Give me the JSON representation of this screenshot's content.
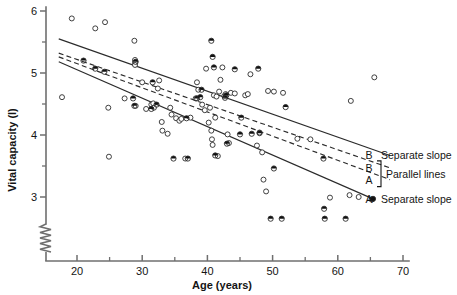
{
  "chart_data": {
    "type": "scatter",
    "title": "",
    "xlabel": "Age  (years)",
    "ylabel": "Vital capacity (l)",
    "xlim": [
      15,
      70
    ],
    "ylim": [
      2.55,
      6
    ],
    "xticks": [
      20,
      30,
      40,
      50,
      60,
      70
    ],
    "xminorticks": [
      25,
      35,
      45,
      55,
      65
    ],
    "yticks": [
      3,
      4,
      5,
      6
    ],
    "yminorticks": [
      3.5,
      4.5,
      5.5
    ],
    "yaxis_break": true,
    "grid": false,
    "legend_position": "right-inside",
    "series": [
      {
        "name": "A",
        "marker": "open-circle",
        "x": [
          17.7,
          19.2,
          22.8,
          24.3,
          24.8,
          24.9,
          27.3,
          28.8,
          29.0,
          28.9,
          28.9,
          28.9,
          30.0,
          30.6,
          31.4,
          31.7,
          31.8,
          32.4,
          32.6,
          33.0,
          33.1,
          33.9,
          34.3,
          34.5,
          35.2,
          35.7,
          36.0,
          36.6,
          37.4,
          38.2,
          38.4,
          38.6,
          39.2,
          39.6,
          39.8,
          40.2,
          40.4,
          40.6,
          40.7,
          40.8,
          41.0,
          41.2,
          41.4,
          41.6,
          41.8,
          42.0,
          42.3,
          42.6,
          42.8,
          43.1,
          43.3,
          43.6,
          44.2,
          45.8,
          46.2,
          46.6,
          47.6,
          48.0,
          48.4,
          48.6,
          49.0,
          49.3,
          50.2,
          51.6,
          53.8,
          55.8,
          58.8,
          61.8,
          62.0,
          63.2,
          65.6
        ],
        "y": [
          4.61,
          5.88,
          5.72,
          5.82,
          4.44,
          3.65,
          4.59,
          5.52,
          4.47,
          5.21,
          5.17,
          5.13,
          4.85,
          4.42,
          4.49,
          4.51,
          4.44,
          4.75,
          4.88,
          4.21,
          4.07,
          4.02,
          4.44,
          4.33,
          4.27,
          4.23,
          4.26,
          3.62,
          4.28,
          4.59,
          4.85,
          4.73,
          4.49,
          4.4,
          5.07,
          4.2,
          4.44,
          4.07,
          3.93,
          3.84,
          4.64,
          4.28,
          4.62,
          3.66,
          4.7,
          4.89,
          5.09,
          4.63,
          4.66,
          4.01,
          3.87,
          4.68,
          4.67,
          4.64,
          4.66,
          4.98,
          3.83,
          4.04,
          3.72,
          3.28,
          3.09,
          4.71,
          4.7,
          4.68,
          3.94,
          3.93,
          2.99,
          3.03,
          4.55,
          3.0,
          4.93
        ]
      },
      {
        "name": "B",
        "marker": "half-filled-circle",
        "x": [
          21.0,
          22.8,
          24.2,
          28.6,
          28.8,
          29.0,
          31.4,
          31.6,
          32.2,
          34.8,
          36.8,
          37.0,
          38.4,
          38.9,
          39.1,
          40.6,
          40.8,
          41.2,
          41.0,
          42.7,
          42.9,
          43.0,
          44.2,
          45.0,
          45.2,
          46.8,
          47.8,
          48.0,
          49.7,
          50.2,
          51.4,
          52.0,
          57.8,
          57.9,
          58.0,
          61.2,
          65.2
        ],
        "y": [
          5.2,
          5.07,
          5.02,
          4.59,
          4.47,
          5.18,
          4.42,
          4.85,
          4.49,
          3.62,
          4.27,
          3.62,
          4.59,
          4.61,
          4.73,
          5.52,
          5.26,
          3.67,
          5.09,
          4.6,
          4.64,
          3.86,
          5.06,
          4.01,
          4.28,
          4.02,
          5.07,
          4.03,
          2.65,
          3.46,
          2.65,
          4.45,
          3.62,
          2.81,
          2.65,
          2.65,
          2.96
        ]
      }
    ],
    "fit_lines": [
      {
        "id": "B-separate",
        "label": "B",
        "note": "Separate slope",
        "style": "solid",
        "x1": 17.2,
        "y1": 5.55,
        "x2": 68.0,
        "y2": 3.67
      },
      {
        "id": "B-parallel",
        "label": "B",
        "note": "Parallel lines",
        "style": "dashed",
        "x1": 17.2,
        "y1": 5.32,
        "x2": 68.0,
        "y2": 3.47
      },
      {
        "id": "A-parallel",
        "label": "A",
        "note": "Parallel lines",
        "style": "dashed",
        "x1": 17.2,
        "y1": 5.26,
        "x2": 68.0,
        "y2": 3.28
      },
      {
        "id": "A-separate",
        "label": "A",
        "note": "Separate slope",
        "style": "solid",
        "x1": 17.2,
        "y1": 5.18,
        "x2": 65.4,
        "y2": 2.97
      }
    ],
    "annotations": [
      {
        "name": "legend-b-separate",
        "key": "B",
        "text": "Separate slope"
      },
      {
        "name": "legend-b-parallel",
        "key": "B",
        "text": ""
      },
      {
        "name": "legend-parallel-group",
        "key": "",
        "text": "Parallel lines"
      },
      {
        "name": "legend-a-parallel",
        "key": "A",
        "text": ""
      },
      {
        "name": "legend-a-separate",
        "key": "A",
        "text": "Separate slope"
      }
    ],
    "colors": {
      "axis": "#6f6f6f",
      "line": "#2b2b2b",
      "marker_edge": "#2b2b2b",
      "marker_fill_open": "#ffffff",
      "marker_fill_solid": "#111111",
      "text": "#141414",
      "background": "#ffffff"
    }
  },
  "axis_labels": {
    "x_title": "Age  (years)",
    "y_title": "Vital capacity (l)",
    "x_ticks": [
      "20",
      "30",
      "40",
      "50",
      "60",
      "70"
    ],
    "y_ticks": [
      "3",
      "4",
      "5",
      "6"
    ]
  },
  "legend": {
    "rows": [
      {
        "key": "B",
        "text": "Separate slope"
      },
      {
        "key": "B",
        "text": ""
      },
      {
        "key": "A",
        "text": ""
      },
      {
        "key": "A",
        "text": "Separate slope"
      }
    ],
    "bracket_text": "Parallel lines"
  }
}
